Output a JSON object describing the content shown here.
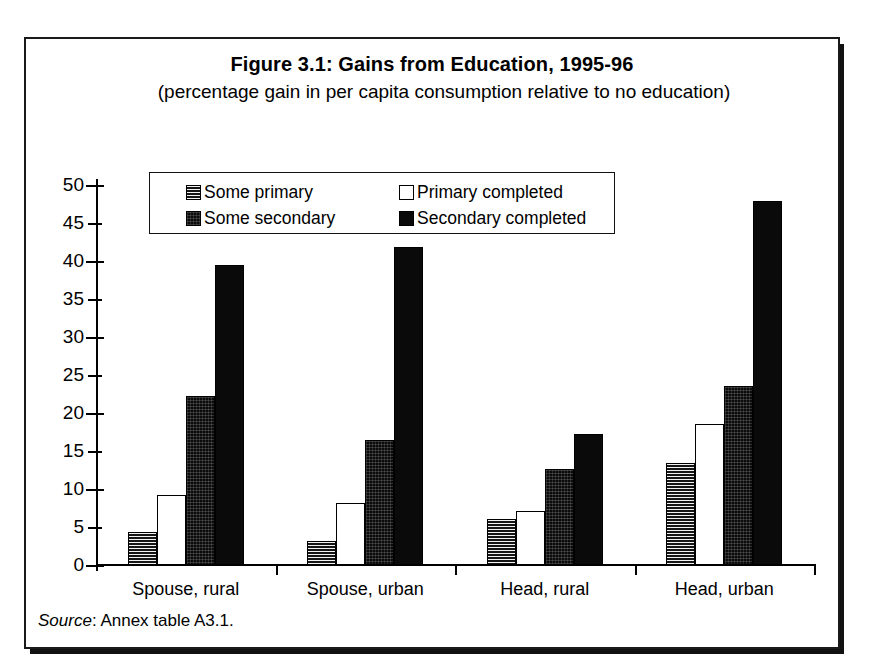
{
  "scan_bleed_text": "",
  "figure": {
    "title": "Figure 3.1: Gains from Education, 1995-96",
    "subtitle": "(percentage gain in per capita consumption relative to no education)",
    "source_word": "Source",
    "source_rest": ": Annex table A3.1."
  },
  "legend": {
    "items": [
      {
        "label": "Some primary",
        "swatch": "horizontal-hatch"
      },
      {
        "label": "Primary completed",
        "swatch": "white-empty"
      },
      {
        "label": "Some secondary",
        "swatch": "dense-crosshatch"
      },
      {
        "label": "Secondary completed",
        "swatch": "solid-black"
      }
    ]
  },
  "chart_data": {
    "type": "bar",
    "title": "Figure 3.1: Gains from Education, 1995-96",
    "subtitle": "(percentage gain in per capita consumption relative to no education)",
    "xlabel": "",
    "ylabel": "",
    "ylim": [
      0,
      50
    ],
    "yticks": [
      0,
      5,
      10,
      15,
      20,
      25,
      30,
      35,
      40,
      45,
      50
    ],
    "ytick_labels": [
      "0",
      "5",
      "10",
      "15",
      "20",
      "25",
      "30",
      "35",
      "40",
      "45",
      "50"
    ],
    "grid": false,
    "legend_position": "top-center-inside",
    "categories": [
      "Spouse, rural",
      "Spouse, urban",
      "Head, rural",
      "Head, urban"
    ],
    "series": [
      {
        "name": "Some primary",
        "values": [
          4.3,
          3.1,
          6.0,
          13.4
        ]
      },
      {
        "name": "Primary completed",
        "values": [
          9.2,
          8.1,
          7.1,
          18.6
        ]
      },
      {
        "name": "Some secondary",
        "values": [
          22.2,
          16.4,
          12.6,
          23.5
        ]
      },
      {
        "name": "Secondary completed",
        "values": [
          39.5,
          41.8,
          17.3,
          47.9
        ]
      }
    ],
    "source": "Source: Annex table A3.1."
  },
  "colors": {
    "ink": "#000000",
    "paper": "#ffffff",
    "bar_solid": "#0a0a0a",
    "bar_dense": "#0b0b0b",
    "bar_hatch": "#1d1d1d",
    "bar_white": "#ffffff"
  }
}
